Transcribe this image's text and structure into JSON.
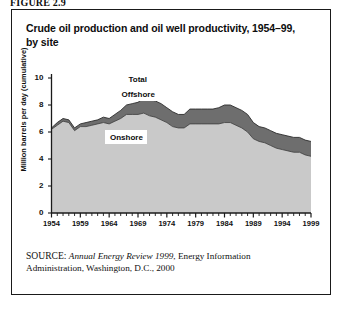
{
  "figure": {
    "label": "FIGURE 2.9",
    "title": "Crude oil production and oil well productivity, 1954–99, by site",
    "source_prefix": "SOURCE:",
    "source_italic": "Annual Energy Review 1999",
    "source_rest": ", Energy Information Administration, Washington, D.C., 2000"
  },
  "colors": {
    "onshore_fill": "#c9c9c9",
    "offshore_fill": "#6e6e6e",
    "axis": "#1a1a1a",
    "border": "#1a1a1a",
    "label_text": "#0d0d0d",
    "page_background": "#ffffff"
  },
  "chart_data": {
    "type": "area",
    "stacked": true,
    "title": "Crude oil production and oil well productivity, 1954–99, by site",
    "xlabel": "",
    "ylabel": "Million barrels per day (cumulative)",
    "xlim": [
      1954,
      1999
    ],
    "ylim": [
      0,
      10
    ],
    "yticks": [
      0,
      2,
      4,
      6,
      8,
      10
    ],
    "ytick_labels": [
      "0",
      "2",
      "4",
      "6",
      "8",
      "10"
    ],
    "xticks": [
      1954,
      1959,
      1964,
      1969,
      1974,
      1979,
      1984,
      1989,
      1994,
      1999
    ],
    "xtick_labels": [
      "1954",
      "1959",
      "1964",
      "1969",
      "1974",
      "1979",
      "1984",
      "1989",
      "1994",
      "1999"
    ],
    "minor_xtick_interval": 1,
    "grid": false,
    "legend_position": "inline-annotations",
    "annotations": [
      {
        "text": "Total",
        "x": 1969,
        "y": 9.9,
        "boxed": false
      },
      {
        "text": "Offshore",
        "x": 1969,
        "y": 8.8,
        "boxed": true
      },
      {
        "text": "Onshore",
        "x": 1967,
        "y": 5.6,
        "boxed": true
      }
    ],
    "x": [
      1954,
      1955,
      1956,
      1957,
      1958,
      1959,
      1960,
      1961,
      1962,
      1963,
      1964,
      1965,
      1966,
      1967,
      1968,
      1969,
      1970,
      1971,
      1972,
      1973,
      1974,
      1975,
      1976,
      1977,
      1978,
      1979,
      1980,
      1981,
      1982,
      1983,
      1984,
      1985,
      1986,
      1987,
      1988,
      1989,
      1990,
      1991,
      1992,
      1993,
      1994,
      1995,
      1996,
      1997,
      1998,
      1999
    ],
    "series": [
      {
        "name": "Onshore",
        "fill": "#c9c9c9",
        "values": [
          6.2,
          6.5,
          6.8,
          6.7,
          6.1,
          6.4,
          6.4,
          6.5,
          6.6,
          6.7,
          6.6,
          6.8,
          7.0,
          7.3,
          7.3,
          7.3,
          7.4,
          7.2,
          7.1,
          6.9,
          6.7,
          6.4,
          6.3,
          6.3,
          6.6,
          6.6,
          6.6,
          6.6,
          6.6,
          6.6,
          6.7,
          6.7,
          6.5,
          6.3,
          6.0,
          5.5,
          5.3,
          5.2,
          5.0,
          4.8,
          4.7,
          4.6,
          4.5,
          4.5,
          4.3,
          4.2
        ]
      },
      {
        "name": "Offshore",
        "fill": "#6e6e6e",
        "values": [
          0.1,
          0.2,
          0.2,
          0.2,
          0.2,
          0.2,
          0.3,
          0.3,
          0.3,
          0.4,
          0.4,
          0.5,
          0.6,
          0.7,
          0.8,
          0.9,
          1.1,
          1.2,
          1.2,
          1.2,
          1.1,
          1.1,
          1.0,
          1.0,
          1.1,
          1.1,
          1.1,
          1.1,
          1.1,
          1.2,
          1.3,
          1.3,
          1.3,
          1.3,
          1.3,
          1.2,
          1.1,
          1.1,
          1.1,
          1.1,
          1.1,
          1.1,
          1.1,
          1.1,
          1.1,
          1.1
        ]
      }
    ],
    "total_values": [
      6.3,
      6.7,
      7.0,
      6.9,
      6.3,
      6.6,
      6.7,
      6.8,
      6.9,
      7.1,
      7.0,
      7.3,
      7.6,
      8.0,
      8.1,
      8.2,
      8.5,
      8.4,
      8.3,
      8.1,
      7.8,
      7.5,
      7.3,
      7.3,
      7.7,
      7.7,
      7.7,
      7.7,
      7.7,
      7.8,
      8.0,
      8.0,
      7.8,
      7.6,
      7.3,
      6.7,
      6.4,
      6.3,
      6.1,
      5.9,
      5.8,
      5.7,
      5.6,
      5.6,
      5.4,
      5.3
    ]
  }
}
